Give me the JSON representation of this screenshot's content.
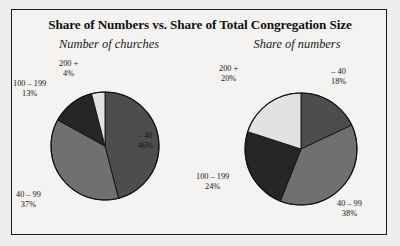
{
  "figure": {
    "title": "Share of Numbers vs. Share of Total Congregation Size",
    "background_color": "#efeeec",
    "border_color": "#1b1b1b"
  },
  "palette": {
    "slice_minus40": "#4d4d4d",
    "slice_40_99": "#707070",
    "slice_100_199": "#262626",
    "slice_200plus": "#e2e2e0",
    "outline": "#101010"
  },
  "chart_data": [
    {
      "type": "pie",
      "title": "Number of churches",
      "categories": [
        "– 40",
        "40 – 99",
        "100 – 199",
        "200 +"
      ],
      "values": [
        46,
        37,
        13,
        4
      ],
      "value_labels": [
        "46%",
        "37%",
        "13%",
        "4%"
      ],
      "colors": [
        "#4d4d4d",
        "#707070",
        "#262626",
        "#e2e2e0"
      ],
      "start_angle_deg": 0,
      "direction": "clockwise",
      "legend": "none",
      "grid": false
    },
    {
      "type": "pie",
      "title": "Share of numbers",
      "categories": [
        "– 40",
        "40 – 99",
        "100 – 199",
        "200 +"
      ],
      "values": [
        18,
        38,
        24,
        20
      ],
      "value_labels": [
        "18%",
        "38%",
        "24%",
        "20%"
      ],
      "colors": [
        "#4d4d4d",
        "#707070",
        "#262626",
        "#e2e2e0"
      ],
      "start_angle_deg": 0,
      "direction": "clockwise",
      "legend": "none",
      "grid": false
    }
  ]
}
